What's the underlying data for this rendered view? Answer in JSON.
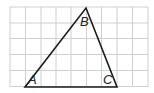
{
  "diagram": {
    "type": "triangle-on-grid",
    "grid": {
      "columns": 9,
      "rows": 5,
      "color": "#cfcfcf",
      "line_color_hex": "#cfcfcf"
    },
    "triangle": {
      "stroke": "#1a1a1a",
      "vertices": [
        {
          "name": "A",
          "x": 25,
          "y": 87,
          "label": "A"
        },
        {
          "name": "B",
          "x": 86,
          "y": 8,
          "label": "B"
        },
        {
          "name": "C",
          "x": 117,
          "y": 87,
          "label": "C"
        }
      ]
    }
  }
}
